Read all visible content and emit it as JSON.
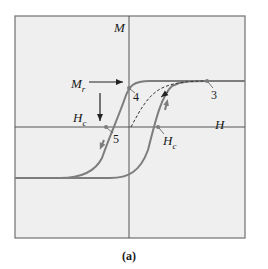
{
  "diagram": {
    "type": "hysteresis-loop",
    "caption": "(a)",
    "axes": {
      "x_label": "H",
      "y_label": "M"
    },
    "labels": {
      "remanence": {
        "main": "M",
        "sub": "r"
      },
      "coercivity_left": {
        "main": "H",
        "sub": "c"
      },
      "coercivity_right": {
        "main": "H",
        "sub": "c"
      }
    },
    "points": [
      {
        "id": "3",
        "label": "3",
        "meaning": "saturation"
      },
      {
        "id": "4",
        "label": "4",
        "meaning": "remanent magnetization"
      },
      {
        "id": "5",
        "label": "5",
        "meaning": "negative coercive field"
      }
    ],
    "colors": {
      "background": "#efefef",
      "frame": "#7a7a7a",
      "axes": "#555555",
      "curve": "#7d7d7d",
      "arrow": "#333333",
      "text": "#1a1a1a"
    }
  }
}
